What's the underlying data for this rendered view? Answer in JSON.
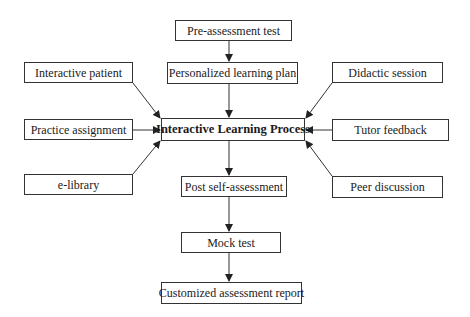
{
  "diagram": {
    "colors": {
      "background": "#ffffff",
      "border": "#333333",
      "text": "#1a1a1a",
      "arrow": "#333333"
    },
    "nodes": {
      "pre_assessment": {
        "label": "Pre-assessment test",
        "x": 175,
        "y": 20,
        "w": 117,
        "h": 21
      },
      "personalized_plan": {
        "label": "Personalized learning plan",
        "x": 167,
        "y": 62,
        "w": 131,
        "h": 22
      },
      "center": {
        "label": "Interactive Learning Process",
        "x": 161,
        "y": 118,
        "w": 144,
        "h": 23
      },
      "interactive_patient": {
        "label": "Interactive patient",
        "x": 24,
        "y": 62,
        "w": 109,
        "h": 21
      },
      "practice_assignment": {
        "label": "Practice assignment",
        "x": 24,
        "y": 119,
        "w": 109,
        "h": 21
      },
      "e_library": {
        "label": "e-library",
        "x": 24,
        "y": 174,
        "w": 109,
        "h": 21
      },
      "didactic_session": {
        "label": "Didactic session",
        "x": 332,
        "y": 62,
        "w": 111,
        "h": 21
      },
      "tutor_feedback": {
        "label": "Tutor feedback",
        "x": 332,
        "y": 119,
        "w": 117,
        "h": 22
      },
      "peer_discussion": {
        "label": "Peer discussion",
        "x": 332,
        "y": 176,
        "w": 111,
        "h": 22
      },
      "post_self_assessment": {
        "label": "Post self-assessment",
        "x": 181,
        "y": 176,
        "w": 106,
        "h": 21
      },
      "mock_test": {
        "label": "Mock test",
        "x": 181,
        "y": 232,
        "w": 100,
        "h": 21
      },
      "customized_report": {
        "label": "Customized assessment report",
        "x": 161,
        "y": 282,
        "w": 141,
        "h": 22
      }
    },
    "edges": [
      {
        "from": "Pre-assessment test",
        "to": "Personalized learning plan"
      },
      {
        "from": "Personalized learning plan",
        "to": "Interactive Learning Process"
      },
      {
        "from": "Interactive patient",
        "to": "Interactive Learning Process"
      },
      {
        "from": "Practice assignment",
        "to": "Interactive Learning Process"
      },
      {
        "from": "e-library",
        "to": "Interactive Learning Process"
      },
      {
        "from": "Didactic session",
        "to": "Interactive Learning Process"
      },
      {
        "from": "Tutor feedback",
        "to": "Interactive Learning Process"
      },
      {
        "from": "Peer discussion",
        "to": "Interactive Learning Process"
      },
      {
        "from": "Interactive Learning Process",
        "to": "Post self-assessment"
      },
      {
        "from": "Post self-assessment",
        "to": "Mock test"
      },
      {
        "from": "Mock test",
        "to": "Customized assessment report"
      }
    ]
  }
}
